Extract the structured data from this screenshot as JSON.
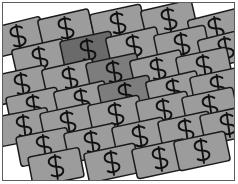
{
  "image": {
    "title": "Scattered Money Bills Illustration",
    "caption": "Many overlapping gray banknotes each marked with a dollar sign",
    "symbol": "$",
    "note_label": "banknote",
    "colors": {
      "background": "#ffffff",
      "frame_border": "#5c5c5c",
      "note_fill": "#9c9c9c",
      "note_fill_shaded": "#7d7d7d",
      "note_fill_dark": "#6a6a6a",
      "note_outline": "#1a1a1a",
      "symbol_ink": "#111111"
    },
    "frame": {
      "x": 2,
      "y": 2,
      "width": 233,
      "height": 179,
      "stroke_width": 1
    },
    "note_geometry": {
      "width": 52,
      "height": 30,
      "corner_radius": 3,
      "base_rotation_deg": -13
    },
    "notes": [
      {
        "x": -8,
        "y": 22,
        "rot": -14,
        "shade": "base"
      },
      {
        "x": 40,
        "y": 14,
        "rot": -13,
        "shade": "base"
      },
      {
        "x": 92,
        "y": 9,
        "rot": -12,
        "shade": "base"
      },
      {
        "x": 143,
        "y": 5,
        "rot": -13,
        "shade": "base"
      },
      {
        "x": 190,
        "y": 14,
        "rot": -14,
        "shade": "base"
      },
      {
        "x": 14,
        "y": 44,
        "rot": -13,
        "shade": "base"
      },
      {
        "x": 62,
        "y": 36,
        "rot": -12,
        "shade": "dark"
      },
      {
        "x": 108,
        "y": 32,
        "rot": -13,
        "shade": "base"
      },
      {
        "x": 156,
        "y": 30,
        "rot": -12,
        "shade": "base"
      },
      {
        "x": 200,
        "y": 34,
        "rot": -14,
        "shade": "base"
      },
      {
        "x": -4,
        "y": 70,
        "rot": -12,
        "shade": "base"
      },
      {
        "x": 44,
        "y": 64,
        "rot": -13,
        "shade": "base"
      },
      {
        "x": 88,
        "y": 58,
        "rot": -12,
        "shade": "shaded"
      },
      {
        "x": 132,
        "y": 55,
        "rot": -13,
        "shade": "base"
      },
      {
        "x": 178,
        "y": 52,
        "rot": -12,
        "shade": "base"
      },
      {
        "x": 8,
        "y": 92,
        "rot": -12,
        "shade": "base"
      },
      {
        "x": 56,
        "y": 86,
        "rot": -13,
        "shade": "base"
      },
      {
        "x": 100,
        "y": 80,
        "rot": -12,
        "shade": "shaded"
      },
      {
        "x": 148,
        "y": 76,
        "rot": -13,
        "shade": "base"
      },
      {
        "x": 192,
        "y": 72,
        "rot": -12,
        "shade": "base"
      },
      {
        "x": -2,
        "y": 112,
        "rot": -11,
        "shade": "base"
      },
      {
        "x": 42,
        "y": 108,
        "rot": -12,
        "shade": "base"
      },
      {
        "x": 90,
        "y": 100,
        "rot": -12,
        "shade": "base"
      },
      {
        "x": 138,
        "y": 96,
        "rot": -12,
        "shade": "base"
      },
      {
        "x": 184,
        "y": 92,
        "rot": -12,
        "shade": "base"
      },
      {
        "x": 18,
        "y": 132,
        "rot": -11,
        "shade": "base"
      },
      {
        "x": 66,
        "y": 128,
        "rot": -12,
        "shade": "base"
      },
      {
        "x": 114,
        "y": 122,
        "rot": -12,
        "shade": "base"
      },
      {
        "x": 160,
        "y": 116,
        "rot": -12,
        "shade": "base"
      },
      {
        "x": 202,
        "y": 110,
        "rot": -12,
        "shade": "base"
      },
      {
        "x": 30,
        "y": 152,
        "rot": -11,
        "shade": "base"
      },
      {
        "x": 86,
        "y": 148,
        "rot": -12,
        "shade": "base"
      },
      {
        "x": 134,
        "y": 144,
        "rot": -12,
        "shade": "base"
      },
      {
        "x": 176,
        "y": 136,
        "rot": -12,
        "shade": "base"
      }
    ]
  }
}
